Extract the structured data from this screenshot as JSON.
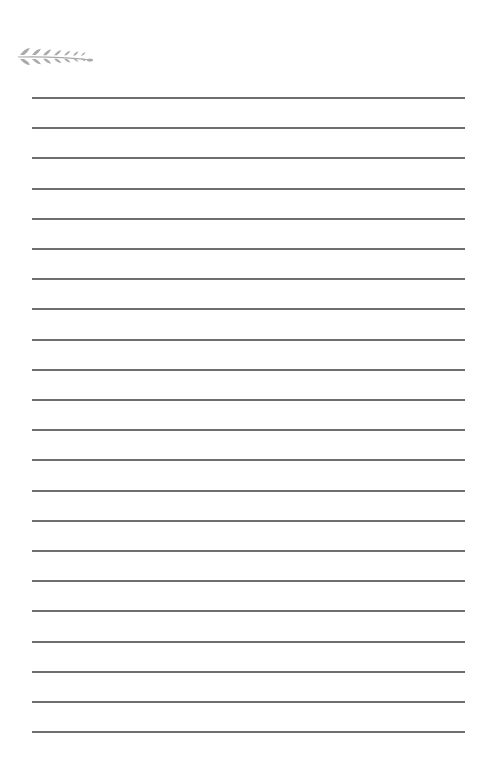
{
  "page": {
    "type": "lined-notepaper",
    "background_color": "#ffffff"
  },
  "ornament": {
    "icon": "wheat-stalk-icon",
    "color": "#aaaaaa"
  },
  "rules": {
    "count": 22,
    "first_y": 97,
    "spacing": 30.2,
    "left": 32,
    "right": 465,
    "color": "#6f6f6f"
  }
}
